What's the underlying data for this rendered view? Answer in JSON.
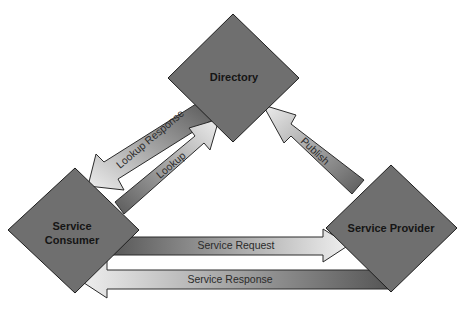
{
  "diagram": {
    "nodes": {
      "directory": {
        "label": "Directory"
      },
      "consumer": {
        "label_line1": "Service",
        "label_line2": "Consumer"
      },
      "provider": {
        "label": "Service Provider"
      }
    },
    "arrows": {
      "lookup_response": {
        "label": "Lookup Response",
        "from": "Directory",
        "to": "Service Consumer"
      },
      "lookup": {
        "label": "Lookup",
        "from": "Service Consumer",
        "to": "Directory"
      },
      "publish": {
        "label": "Publish",
        "from": "Service Provider",
        "to": "Directory"
      },
      "service_request": {
        "label": "Service Request",
        "from": "Service Consumer",
        "to": "Service Provider"
      },
      "service_response": {
        "label": "Service Response",
        "from": "Service Provider",
        "to": "Service Consumer"
      }
    },
    "colors": {
      "node_fill": "#6f6f6f",
      "arrow_dark": "#5a5a5a",
      "arrow_light": "#ececec",
      "outline": "#1e1e1e",
      "background": "#ffffff"
    }
  }
}
